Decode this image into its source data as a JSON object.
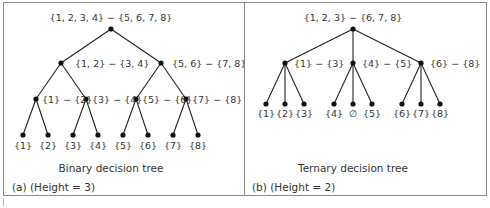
{
  "figure": {
    "panel_a": {
      "tree_type": "Binary decision tree",
      "caption": "(a)  (Height = 3)",
      "root": {
        "label": "{1, 2, 3, 4} − {5, 6, 7, 8}"
      },
      "level1": [
        {
          "label": "{1, 2} − {3, 4}"
        },
        {
          "label": "{5, 6} − {7, 8}"
        }
      ],
      "level2": [
        {
          "label": "{1} − {2}"
        },
        {
          "label": "{3} − {4}"
        },
        {
          "label": "{5} − {6}"
        },
        {
          "label": "{7} − {8}"
        }
      ],
      "leaves": [
        "{1}",
        "{2}",
        "{3}",
        "{4}",
        "{5}",
        "{6}",
        "{7}",
        "{8}"
      ]
    },
    "panel_b": {
      "tree_type": "Ternary decision tree",
      "caption": "(b)  (Height = 2)",
      "root": {
        "label": "{1, 2, 3} − {6, 7, 8}"
      },
      "level1": [
        {
          "label": "{1} − {3}"
        },
        {
          "label": "{4} − {5}"
        },
        {
          "label": "{6} − {8}"
        }
      ],
      "leaves": [
        "{1}",
        "{2}",
        "{3}",
        "{4}",
        "∅",
        "{5}",
        "{6}",
        "{7}",
        "{8}"
      ]
    }
  }
}
